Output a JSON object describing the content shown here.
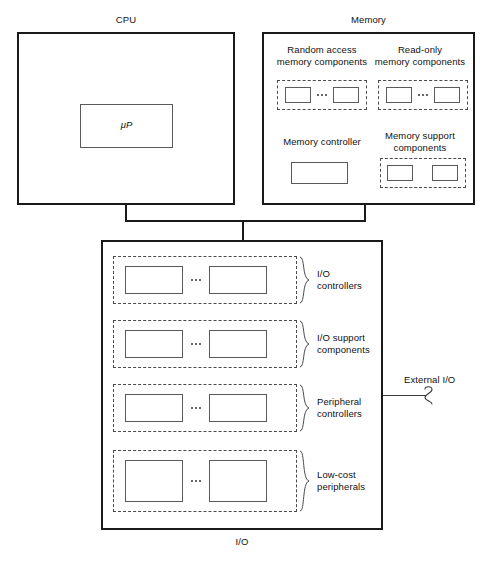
{
  "diagram": {
    "title_cpu": "CPU",
    "title_memory": "Memory",
    "title_io": "I/O",
    "external_io_label": "External I/O"
  },
  "cpu": {
    "label": "CPU",
    "processor_label": "μP"
  },
  "memory": {
    "label": "Memory",
    "groups": [
      {
        "name": "ram",
        "label": "Random access\nmemory components",
        "chip_count": 2,
        "has_ellipsis": true
      },
      {
        "name": "rom",
        "label": "Read-only\nmemory components",
        "chip_count": 2,
        "has_ellipsis": true
      },
      {
        "name": "memory-support",
        "label": "Memory support\ncomponents",
        "chip_count": 2,
        "has_ellipsis": false
      }
    ],
    "controller": {
      "label": "Memory controller"
    }
  },
  "io": {
    "label": "I/O",
    "external_label": "External I/O",
    "rows": [
      {
        "name": "io-controllers",
        "label": "I/O\ncontrollers",
        "chip_count": 2,
        "has_ellipsis": true
      },
      {
        "name": "io-support-components",
        "label": "I/O support\ncomponents",
        "chip_count": 2,
        "has_ellipsis": true
      },
      {
        "name": "peripheral-controllers",
        "label": "Peripheral\ncontrollers",
        "chip_count": 2,
        "has_ellipsis": true
      },
      {
        "name": "low-cost-peripherals",
        "label": "Low-cost\nperipherals",
        "chip_count": 2,
        "has_ellipsis": true
      }
    ]
  },
  "colors": {
    "outline": "#1a1a1a",
    "dashed": "#4a4a4a",
    "chip": "#5a5a5a",
    "text": "#111111",
    "background": "#ffffff"
  }
}
